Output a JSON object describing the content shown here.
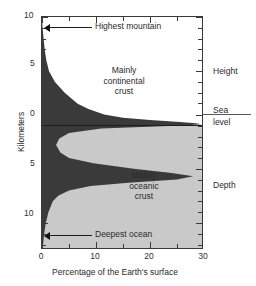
{
  "figure": {
    "kind": "hypsometric-curve",
    "axes": {
      "y": {
        "label": "Kilometers",
        "ticks": [
          {
            "value": 10,
            "label": "10",
            "km": 10
          },
          {
            "value": 5,
            "label": "5",
            "km": 5
          },
          {
            "value": 0,
            "label": "0",
            "km": 0
          },
          {
            "value": -5,
            "label": "5",
            "km": -5
          },
          {
            "value": -10,
            "label": "10",
            "km": -10
          }
        ],
        "range_km": [
          -11.5,
          10.0
        ]
      },
      "x": {
        "label": "Percentage of the Earth's surface",
        "ticks": [
          {
            "value": 0,
            "label": "0"
          },
          {
            "value": 10,
            "label": "10"
          },
          {
            "value": 20,
            "label": "20"
          },
          {
            "value": 30,
            "label": "30"
          }
        ],
        "range": [
          0,
          30
        ]
      }
    },
    "inner_labels": [
      {
        "name": "continental-crust-label",
        "text": "Mainly\ncontinental\ncrust"
      },
      {
        "name": "oceanic-crust-label",
        "text": "Mainly\noceanic\ncrust"
      }
    ],
    "annotations": [
      {
        "name": "highest-mountain",
        "text": "Highest mountain",
        "km": 8.8
      },
      {
        "name": "deepest-ocean",
        "text": "Deepest ocean",
        "km": -11.0
      }
    ],
    "side_labels": {
      "height": "Height",
      "sea_level_line1": "Sea",
      "sea_level_line2": "level",
      "depth": "Depth"
    },
    "colors": {
      "land": "#3a3a3a",
      "ocean": "#c9c9c9",
      "axis": "#3a3a3a",
      "text": "#2a2a2a",
      "background": "#ffffff"
    }
  },
  "chart_data": {
    "type": "area",
    "title": "",
    "subtitle": "",
    "xlabel": "Percentage of the Earth's surface",
    "ylabel": "Kilometers",
    "xlim": [
      0,
      30
    ],
    "ylim": [
      -11.5,
      10.0
    ],
    "grid": false,
    "legend": null,
    "orientation": "horizontal-area-vs-elevation",
    "series": [
      {
        "name": "Percentage of Earth's surface vs elevation",
        "x_unit": "percent",
        "y_unit": "km",
        "points": [
          {
            "km": 10.0,
            "percent": 0.0
          },
          {
            "km": 9.0,
            "percent": 0.1
          },
          {
            "km": 8.8,
            "percent": 0.15
          },
          {
            "km": 8.0,
            "percent": 0.3
          },
          {
            "km": 7.0,
            "percent": 0.5
          },
          {
            "km": 6.0,
            "percent": 0.8
          },
          {
            "km": 5.0,
            "percent": 1.3
          },
          {
            "km": 4.0,
            "percent": 2.4
          },
          {
            "km": 3.0,
            "percent": 4.2
          },
          {
            "km": 2.0,
            "percent": 6.6
          },
          {
            "km": 1.5,
            "percent": 8.6
          },
          {
            "km": 1.0,
            "percent": 11.5
          },
          {
            "km": 0.7,
            "percent": 15.0
          },
          {
            "km": 0.5,
            "percent": 20.0
          },
          {
            "km": 0.3,
            "percent": 25.5
          },
          {
            "km": 0.2,
            "percent": 28.5
          },
          {
            "km": 0.1,
            "percent": 29.5
          },
          {
            "km": 0.0,
            "percent": 27.0
          },
          {
            "km": -0.3,
            "percent": 11.0
          },
          {
            "km": -0.7,
            "percent": 5.0
          },
          {
            "km": -1.2,
            "percent": 3.2
          },
          {
            "km": -1.8,
            "percent": 2.6
          },
          {
            "km": -2.5,
            "percent": 3.4
          },
          {
            "km": -3.0,
            "percent": 5.0
          },
          {
            "km": -3.5,
            "percent": 9.5
          },
          {
            "km": -4.0,
            "percent": 17.0
          },
          {
            "km": -4.4,
            "percent": 24.0
          },
          {
            "km": -4.7,
            "percent": 28.0
          },
          {
            "km": -5.0,
            "percent": 25.0
          },
          {
            "km": -5.3,
            "percent": 16.0
          },
          {
            "km": -5.6,
            "percent": 9.0
          },
          {
            "km": -6.0,
            "percent": 5.0
          },
          {
            "km": -6.5,
            "percent": 3.0
          },
          {
            "km": -7.0,
            "percent": 2.0
          },
          {
            "km": -8.0,
            "percent": 1.2
          },
          {
            "km": -9.0,
            "percent": 0.7
          },
          {
            "km": -10.0,
            "percent": 0.4
          },
          {
            "km": -11.0,
            "percent": 0.2
          },
          {
            "km": -11.5,
            "percent": 0.0
          }
        ]
      }
    ],
    "annotations": [
      {
        "label": "Highest mountain",
        "km": 8.8,
        "percent": 0.2
      },
      {
        "label": "Deepest ocean",
        "km": -11.0,
        "percent": 0.3
      },
      {
        "label": "Sea level",
        "km": 0
      },
      {
        "label": "Mainly continental crust",
        "km": 3.5,
        "percent": 14
      },
      {
        "label": "Mainly oceanic crust",
        "km": -6.5,
        "percent": 18
      },
      {
        "label": "Height",
        "region": "above-sea-level"
      },
      {
        "label": "Depth",
        "region": "below-sea-level"
      }
    ]
  }
}
